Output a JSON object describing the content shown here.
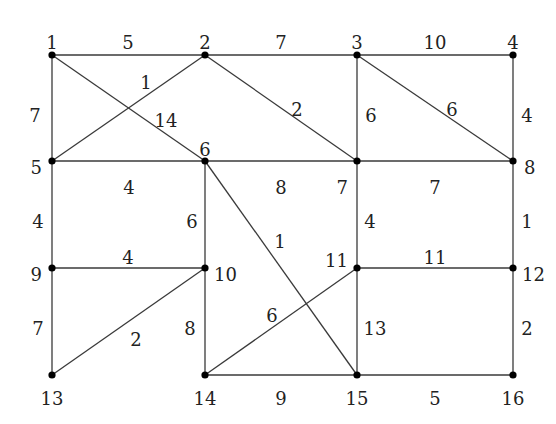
{
  "diagram": {
    "type": "weighted-undirected-graph",
    "nodes": [
      {
        "id": "1",
        "x": 52,
        "y": 55,
        "lx": 52,
        "ly": 44,
        "anchor": "middle"
      },
      {
        "id": "2",
        "x": 205,
        "y": 55,
        "lx": 205,
        "ly": 44,
        "anchor": "middle"
      },
      {
        "id": "3",
        "x": 357,
        "y": 55,
        "lx": 357,
        "ly": 44,
        "anchor": "middle"
      },
      {
        "id": "4",
        "x": 513,
        "y": 55,
        "lx": 513,
        "ly": 44,
        "anchor": "middle"
      },
      {
        "id": "5",
        "x": 52,
        "y": 161,
        "lx": 42,
        "ly": 169,
        "anchor": "end"
      },
      {
        "id": "6",
        "x": 205,
        "y": 161,
        "lx": 205,
        "ly": 151,
        "anchor": "middle"
      },
      {
        "id": "7",
        "x": 357,
        "y": 161,
        "lx": 348,
        "ly": 189,
        "anchor": "end"
      },
      {
        "id": "8",
        "x": 513,
        "y": 161,
        "lx": 524,
        "ly": 169,
        "anchor": "start"
      },
      {
        "id": "9",
        "x": 52,
        "y": 268,
        "lx": 42,
        "ly": 276,
        "anchor": "end"
      },
      {
        "id": "10",
        "x": 205,
        "y": 268,
        "lx": 214,
        "ly": 276,
        "anchor": "start"
      },
      {
        "id": "11",
        "x": 357,
        "y": 268,
        "lx": 348,
        "ly": 262,
        "anchor": "end"
      },
      {
        "id": "12",
        "x": 513,
        "y": 268,
        "lx": 522,
        "ly": 276,
        "anchor": "start"
      },
      {
        "id": "13",
        "x": 52,
        "y": 375,
        "lx": 52,
        "ly": 400,
        "anchor": "middle"
      },
      {
        "id": "14",
        "x": 205,
        "y": 375,
        "lx": 205,
        "ly": 400,
        "anchor": "middle"
      },
      {
        "id": "15",
        "x": 357,
        "y": 375,
        "lx": 357,
        "ly": 400,
        "anchor": "middle"
      },
      {
        "id": "16",
        "x": 513,
        "y": 375,
        "lx": 513,
        "ly": 400,
        "anchor": "middle"
      }
    ],
    "edges": [
      {
        "from": "1",
        "to": "2",
        "weight": "5",
        "wx": 128,
        "wy": 44
      },
      {
        "from": "2",
        "to": "3",
        "weight": "7",
        "wx": 281,
        "wy": 44
      },
      {
        "from": "3",
        "to": "4",
        "weight": "10",
        "wx": 435,
        "wy": 44
      },
      {
        "from": "1",
        "to": "5",
        "weight": "7",
        "wx": 35,
        "wy": 117
      },
      {
        "from": "1",
        "to": "6",
        "weight": "14",
        "wx": 166,
        "wy": 122
      },
      {
        "from": "2",
        "to": "5",
        "weight": "1",
        "wx": 146,
        "wy": 84
      },
      {
        "from": "2",
        "to": "7",
        "weight": "2",
        "wx": 297,
        "wy": 111
      },
      {
        "from": "3",
        "to": "7",
        "weight": "6",
        "wx": 371,
        "wy": 117
      },
      {
        "from": "3",
        "to": "8",
        "weight": "6",
        "wx": 452,
        "wy": 111
      },
      {
        "from": "4",
        "to": "8",
        "weight": "4",
        "wx": 527,
        "wy": 117
      },
      {
        "from": "5",
        "to": "6",
        "weight": "4",
        "wx": 129,
        "wy": 189
      },
      {
        "from": "6",
        "to": "7",
        "weight": "8",
        "wx": 281,
        "wy": 189
      },
      {
        "from": "7",
        "to": "8",
        "weight": "7",
        "wx": 435,
        "wy": 189
      },
      {
        "from": "5",
        "to": "9",
        "weight": "4",
        "wx": 38,
        "wy": 223
      },
      {
        "from": "6",
        "to": "10",
        "weight": "6",
        "wx": 192,
        "wy": 223
      },
      {
        "from": "6",
        "to": "15",
        "weight": "1",
        "wx": 280,
        "wy": 243
      },
      {
        "from": "7",
        "to": "11",
        "weight": "4",
        "wx": 370,
        "wy": 223
      },
      {
        "from": "8",
        "to": "12",
        "weight": "1",
        "wx": 527,
        "wy": 223
      },
      {
        "from": "9",
        "to": "10",
        "weight": "4",
        "wx": 128,
        "wy": 259
      },
      {
        "from": "11",
        "to": "12",
        "weight": "11",
        "wx": 435,
        "wy": 259
      },
      {
        "from": "9",
        "to": "13",
        "weight": "7",
        "wx": 38,
        "wy": 330
      },
      {
        "from": "10",
        "to": "13",
        "weight": "2",
        "wx": 136,
        "wy": 341
      },
      {
        "from": "10",
        "to": "14",
        "weight": "8",
        "wx": 190,
        "wy": 330
      },
      {
        "from": "11",
        "to": "14",
        "weight": "6",
        "wx": 272,
        "wy": 317
      },
      {
        "from": "11",
        "to": "15",
        "weight": "13",
        "wx": 375,
        "wy": 330
      },
      {
        "from": "12",
        "to": "16",
        "weight": "2",
        "wx": 527,
        "wy": 330
      },
      {
        "from": "14",
        "to": "15",
        "weight": "9",
        "wx": 281,
        "wy": 400
      },
      {
        "from": "15",
        "to": "16",
        "weight": "5",
        "wx": 435,
        "wy": 400
      }
    ]
  }
}
